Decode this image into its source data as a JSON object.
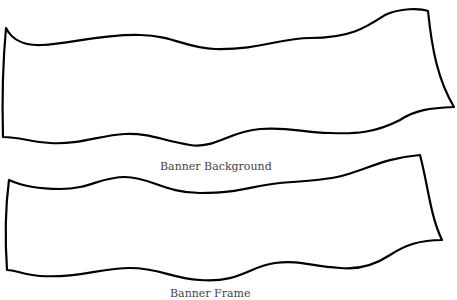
{
  "banners": [
    {
      "label": "Banner Background"
    },
    {
      "label": "Banner Frame"
    }
  ]
}
